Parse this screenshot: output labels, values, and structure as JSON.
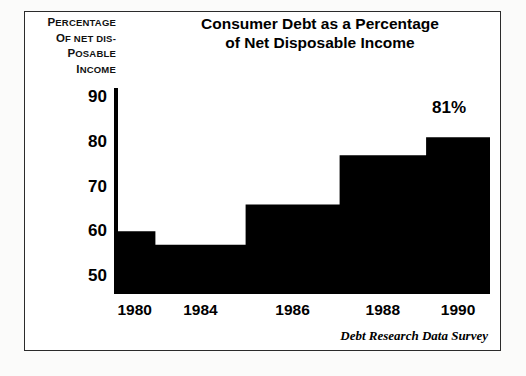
{
  "title": {
    "line1": "Consumer Debt as a Percentage",
    "line2": "of Net Disposable Income"
  },
  "axis_caption": {
    "line1": "Percentage",
    "line2": "of net dis-",
    "line3": "posable",
    "line4": "income"
  },
  "source": "Debt Research Data Survey",
  "annotation": "81%",
  "colors": {
    "fill": "#000000",
    "background": "#ffffff",
    "frame": "#2b2b2b",
    "text": "#000000"
  },
  "chart_data": {
    "type": "area",
    "title": "Consumer Debt as a Percentage of Net Disposable Income",
    "subtitle": "",
    "xlabel": "",
    "ylabel": "Percentage of net disposable income",
    "x": [
      1980,
      1984,
      1986,
      1988,
      1990
    ],
    "categories": [
      "1980",
      "1984",
      "1986",
      "1988",
      "1990"
    ],
    "values": [
      60,
      57,
      66,
      77,
      81
    ],
    "series": [
      {
        "name": "Consumer debt as % of net disposable income",
        "values": [
          60,
          57,
          66,
          77,
          81
        ]
      }
    ],
    "ytick_labels": [
      "90",
      "80",
      "70",
      "60",
      "50"
    ],
    "yticks": [
      90,
      80,
      70,
      60,
      50
    ],
    "xtick_labels": [
      "1980",
      "1984",
      "1986",
      "1988",
      "1990"
    ],
    "ylim": [
      46,
      92
    ],
    "xlim": [
      1979,
      1991.5
    ],
    "grid": false,
    "legend": false,
    "step_style": "post",
    "data_labels": [
      {
        "value": 81,
        "text": "81%",
        "series": 0,
        "index": 4
      }
    ],
    "annotations": [
      {
        "text": "Debt Research Data Survey",
        "position": "bottom-right",
        "style": "italic"
      }
    ]
  }
}
